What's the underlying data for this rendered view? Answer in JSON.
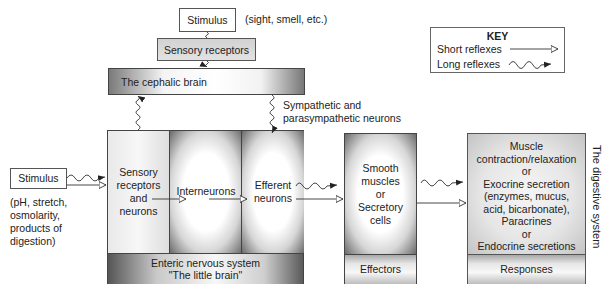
{
  "top": {
    "stimulus_label": "Stimulus",
    "stimulus_note": "(sight, smell, etc.)",
    "sensory_receptors_label": "Sensory receptors",
    "cephalic_brain_label": "The cephalic brain",
    "autonomic_note_line1": "Sympathetic and",
    "autonomic_note_line2": "parasympathetic neurons"
  },
  "key": {
    "title": "KEY",
    "items": [
      {
        "label": "Short reflexes",
        "arrow_style": "straight-open-arrow"
      },
      {
        "label": "Long reflexes",
        "arrow_style": "wavy-filled-arrow"
      }
    ]
  },
  "left": {
    "stimulus_label": "Stimulus",
    "stimulus_note_lines": [
      "(pH, stretch,",
      "osmolarity,",
      "products of",
      "digestion)"
    ]
  },
  "enteric": {
    "sensory_lines": [
      "Sensory",
      "receptors",
      "and",
      "neurons"
    ],
    "interneurons_label": "Interneurons",
    "efferent_lines": [
      "Efferent",
      "neurons"
    ],
    "footer_line1": "Enteric nervous system",
    "footer_line2": "\"The little brain\""
  },
  "effectors": {
    "lines": [
      "Smooth",
      "muscles",
      "or",
      "Secretory",
      "cells"
    ],
    "footer": "Effectors"
  },
  "responses": {
    "lines": [
      "Muscle",
      "contraction/relaxation",
      "or",
      "Exocrine secretion",
      "(enzymes, mucus,",
      "acid, bicarbonate),",
      "Paracrines",
      "or",
      "Endocrine secretions"
    ],
    "footer": "Responses"
  },
  "side_label": "The digestive system",
  "colors": {
    "border": "#555555",
    "arrow": "#222222",
    "box_fill": "#ffffff"
  }
}
